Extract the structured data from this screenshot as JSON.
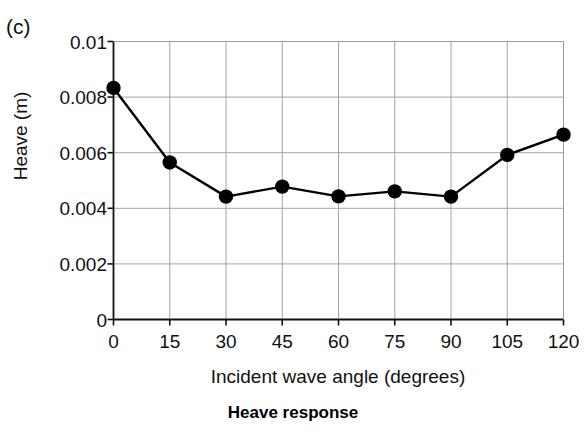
{
  "panel": {
    "label": "(c)"
  },
  "caption": {
    "text": "Heave response"
  },
  "axes": {
    "ylabel": "Heave (m)",
    "xlabel": "Incident wave angle (degrees)"
  },
  "chart_data": {
    "type": "line",
    "title": "Heave response",
    "panel_label": "(c)",
    "xlabel": "Incident wave angle (degrees)",
    "ylabel": "Heave (m)",
    "x": [
      0,
      15,
      30,
      45,
      60,
      75,
      90,
      105,
      120
    ],
    "values": [
      0.00833,
      0.00565,
      0.00442,
      0.00478,
      0.00443,
      0.00461,
      0.00442,
      0.00592,
      0.00665
    ],
    "series": [
      {
        "name": "Heave",
        "values": [
          0.00833,
          0.00565,
          0.00442,
          0.00478,
          0.00443,
          0.00461,
          0.00442,
          0.00592,
          0.00665
        ]
      }
    ],
    "xlim": [
      0,
      120
    ],
    "ylim": [
      0,
      0.01
    ],
    "xticks": [
      0,
      15,
      30,
      45,
      60,
      75,
      90,
      105,
      120
    ],
    "xtick_labels": [
      "0",
      "15",
      "30",
      "45",
      "60",
      "75",
      "90",
      "105",
      "120"
    ],
    "yticks": [
      0,
      0.002,
      0.004,
      0.006,
      0.008,
      0.01
    ],
    "ytick_labels": [
      "0",
      "0.002",
      "0.004",
      "0.006",
      "0.008",
      "0.01"
    ],
    "grid": true,
    "legend": false,
    "marker": "filled-circle",
    "marker_color": "#000000",
    "line_color": "#000000",
    "background": "#ffffff"
  }
}
